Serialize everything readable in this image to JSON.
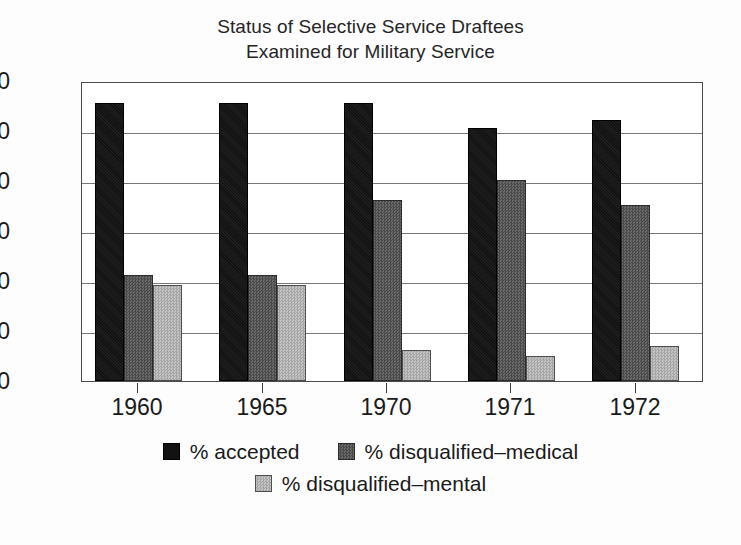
{
  "chart_data": {
    "type": "bar",
    "title": "Status of Selective Service Draftees Examined for Military Service",
    "title_lines": [
      "Status of Selective Service Draftees",
      "Examined for Military Service"
    ],
    "xlabel": "",
    "ylabel": "",
    "categories": [
      "1960",
      "1965",
      "1970",
      "1971",
      "1972"
    ],
    "ylim": [
      0,
      60
    ],
    "yticks": [
      0,
      10,
      20,
      30,
      40,
      50,
      60
    ],
    "ytick_labels": [
      "0",
      "10",
      "20",
      "30",
      "40",
      "50",
      "60"
    ],
    "grid": true,
    "grid_axis": "y",
    "legend_position": "bottom",
    "series": [
      {
        "name": "% accepted",
        "color": "#121212",
        "values": [
          55.6,
          55.6,
          55.6,
          50.7,
          52.3
        ]
      },
      {
        "name": "% disqualified–medical",
        "color": "#565656",
        "values": [
          21.3,
          21.3,
          36.2,
          40.2,
          35.2
        ]
      },
      {
        "name": "% disqualified–mental",
        "color": "#b3b3b3",
        "values": [
          19.2,
          19.2,
          6.2,
          5.0,
          7.0
        ]
      }
    ]
  },
  "colors": {
    "accepted": "#121212",
    "disqualified_medical": "#565656",
    "disqualified_mental": "#b3b3b3",
    "axis": "#4c4c4c",
    "grid": "#777777",
    "background": "#fdfdfd",
    "plot_background": "#ffffff"
  }
}
